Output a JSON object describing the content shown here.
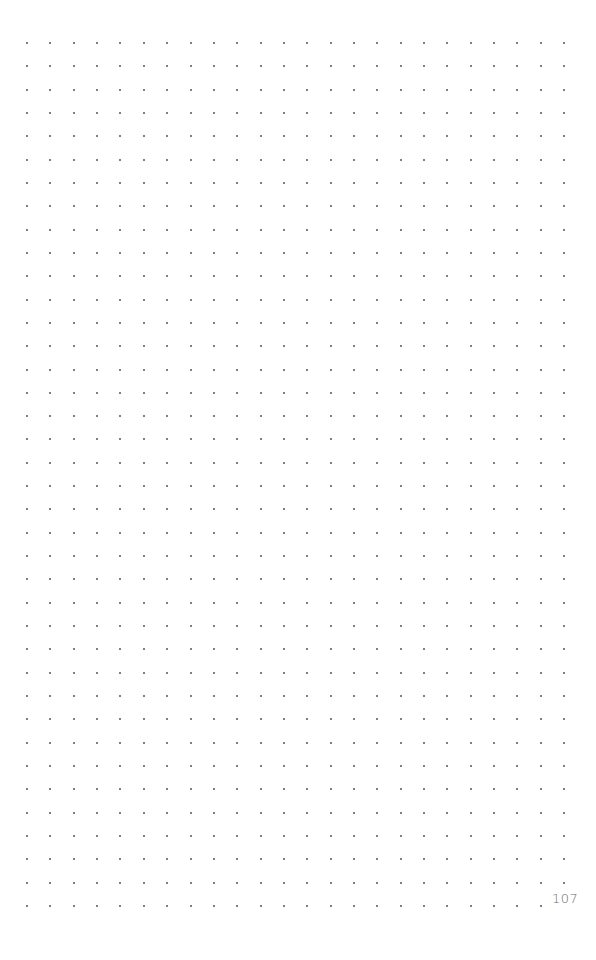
{
  "page": {
    "type": "dot-grid-notebook-page",
    "page_number": "107",
    "background_color": "#ffffff",
    "dot_color": "#555555",
    "page_number_color": "#6a6a6a"
  },
  "grid": {
    "columns": 24,
    "rows": 38,
    "origin_x": 27,
    "origin_y": 43,
    "spacing_x": 23.35,
    "spacing_y": 23.32,
    "dot_size": 2,
    "omit_last_cell": true
  }
}
